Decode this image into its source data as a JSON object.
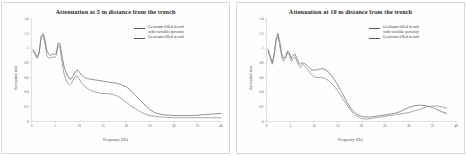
{
  "figure": {
    "panels": [
      {
        "id": "panel-5m",
        "title": "Attenuation at 5 m distance from the trench",
        "xlabel": "Frequency [Hz]",
        "ylabel": "Attenuation ratio",
        "legend": [
          {
            "label": "Geofoam filled trench\nwith variable porosity",
            "color": "#555555"
          },
          {
            "label": "Geofoam filled trench",
            "color": "#555555"
          }
        ]
      },
      {
        "id": "panel-10m",
        "title": "Attenuation at 10 m distance from the trench",
        "xlabel": "Frequency [Hz]",
        "ylabel": "Attenuation ratio",
        "legend": [
          {
            "label": "Geofoam filled trench\nwith variable porosity",
            "color": "#555555"
          },
          {
            "label": "Geofoam filled trench",
            "color": "#555555"
          }
        ]
      }
    ]
  },
  "chart_data": [
    {
      "type": "line",
      "title": "Attenuation at 5 m distance from the trench",
      "xlabel": "Frequency [Hz]",
      "ylabel": "Attenuation ratio",
      "xlim": [
        0,
        40
      ],
      "ylim": [
        0,
        1.4
      ],
      "xticks": [
        0,
        5,
        10,
        15,
        20,
        25,
        30,
        35,
        40
      ],
      "yticks": [
        0,
        0.2,
        0.4,
        0.6,
        0.8,
        1,
        1.2,
        1.4
      ],
      "xticklabels": [
        "0",
        "5",
        "10",
        "15",
        "20",
        "25",
        "30",
        "35",
        "40"
      ],
      "yticklabels": [
        "0",
        "0.2",
        "0.4",
        "0.6",
        "0.8",
        "1",
        "1.2",
        "1.4"
      ],
      "grid": false,
      "legend_position": "upper right",
      "series": [
        {
          "name": "Geofoam filled trench with variable porosity",
          "color": "#555555",
          "x": [
            0.3,
            0.8,
            1.2,
            1.6,
            2.0,
            2.4,
            2.8,
            3.2,
            3.6,
            4.0,
            4.4,
            4.8,
            5.2,
            5.6,
            6.0,
            6.4,
            6.8,
            7.2,
            7.6,
            8.0,
            8.4,
            8.8,
            9.2,
            9.6,
            10.0,
            10.6,
            11.2,
            12.0,
            13.0,
            14.0,
            15.0,
            16.0,
            17.0,
            18.0,
            19.0,
            20.0,
            21.0,
            22.0,
            23.0,
            24.0,
            25.0,
            26.0,
            27.0,
            28.0,
            30.0,
            32.0,
            34.0,
            36.0,
            38.0,
            40.0
          ],
          "y": [
            0.98,
            0.92,
            0.88,
            0.95,
            1.16,
            1.2,
            1.12,
            0.97,
            0.92,
            0.9,
            0.92,
            0.91,
            0.93,
            1.07,
            1.06,
            0.9,
            0.76,
            0.68,
            0.62,
            0.58,
            0.58,
            0.62,
            0.68,
            0.7,
            0.68,
            0.63,
            0.6,
            0.58,
            0.57,
            0.56,
            0.55,
            0.54,
            0.53,
            0.52,
            0.5,
            0.47,
            0.42,
            0.35,
            0.28,
            0.22,
            0.16,
            0.12,
            0.1,
            0.09,
            0.08,
            0.08,
            0.08,
            0.09,
            0.1,
            0.11
          ]
        },
        {
          "name": "Geofoam filled trench",
          "color": "#777777",
          "x": [
            0.3,
            0.8,
            1.2,
            1.6,
            2.0,
            2.4,
            2.8,
            3.2,
            3.6,
            4.0,
            4.4,
            4.8,
            5.2,
            5.6,
            6.0,
            6.4,
            6.8,
            7.2,
            7.6,
            8.0,
            8.4,
            8.8,
            9.2,
            9.6,
            10.0,
            10.6,
            11.2,
            12.0,
            13.0,
            14.0,
            15.0,
            16.0,
            17.0,
            18.0,
            19.0,
            20.0,
            21.0,
            22.0,
            23.0,
            24.0,
            25.0,
            26.0,
            27.0,
            28.0,
            30.0,
            32.0,
            34.0,
            36.0,
            38.0,
            40.0
          ],
          "y": [
            0.96,
            0.9,
            0.86,
            0.93,
            1.14,
            1.17,
            1.07,
            0.9,
            0.86,
            0.87,
            0.88,
            0.87,
            0.9,
            1.04,
            1.0,
            0.82,
            0.66,
            0.58,
            0.52,
            0.5,
            0.52,
            0.57,
            0.61,
            0.62,
            0.58,
            0.52,
            0.48,
            0.44,
            0.41,
            0.39,
            0.38,
            0.38,
            0.37,
            0.35,
            0.31,
            0.26,
            0.21,
            0.17,
            0.13,
            0.1,
            0.08,
            0.07,
            0.06,
            0.06,
            0.05,
            0.05,
            0.05,
            0.05,
            0.05,
            0.05
          ]
        }
      ]
    },
    {
      "type": "line",
      "title": "Attenuation at 10 m distance from the trench",
      "xlabel": "Frequency [Hz]",
      "ylabel": "Attenuation ratio",
      "xlim": [
        0,
        40
      ],
      "ylim": [
        0,
        1.4
      ],
      "xticks": [
        0,
        5,
        10,
        15,
        20,
        25,
        30,
        35,
        40
      ],
      "yticks": [
        0,
        0.2,
        0.4,
        0.6,
        0.8,
        1,
        1.2,
        1.4
      ],
      "xticklabels": [
        "0",
        "5",
        "10",
        "15",
        "20",
        "25",
        "30",
        "35",
        "40"
      ],
      "yticklabels": [
        "0",
        "0.2",
        "0.4",
        "0.6",
        "0.8",
        "1",
        "1.2",
        "1.4"
      ],
      "grid": false,
      "legend_position": "upper right",
      "series": [
        {
          "name": "Geofoam filled trench with variable porosity",
          "color": "#555555",
          "x": [
            0.3,
            0.8,
            1.2,
            1.6,
            2.0,
            2.4,
            2.8,
            3.2,
            3.6,
            4.0,
            4.4,
            4.8,
            5.2,
            5.6,
            6.0,
            6.4,
            6.8,
            7.2,
            7.6,
            8.0,
            8.6,
            9.2,
            9.8,
            10.4,
            11.0,
            11.6,
            12.2,
            13.0,
            14.0,
            15.0,
            16.0,
            17.0,
            18.0,
            19.0,
            20.0,
            21.0,
            22.0,
            23.0,
            24.0,
            25.0,
            26.0,
            27.0,
            28.0,
            29.0,
            30.0,
            31.0,
            32.0,
            33.0,
            34.0,
            35.0,
            36.0,
            37.0,
            38.0
          ],
          "y": [
            0.98,
            0.88,
            0.8,
            0.92,
            1.12,
            1.2,
            1.08,
            0.92,
            0.86,
            0.88,
            0.96,
            0.94,
            0.86,
            0.9,
            0.92,
            0.86,
            0.8,
            0.78,
            0.8,
            0.79,
            0.76,
            0.72,
            0.7,
            0.7,
            0.71,
            0.72,
            0.71,
            0.68,
            0.6,
            0.5,
            0.38,
            0.26,
            0.16,
            0.1,
            0.07,
            0.06,
            0.06,
            0.07,
            0.08,
            0.09,
            0.1,
            0.11,
            0.13,
            0.16,
            0.19,
            0.21,
            0.22,
            0.22,
            0.21,
            0.19,
            0.16,
            0.13,
            0.11
          ]
        },
        {
          "name": "Geofoam filled trench",
          "color": "#777777",
          "x": [
            0.3,
            0.8,
            1.2,
            1.6,
            2.0,
            2.4,
            2.8,
            3.2,
            3.6,
            4.0,
            4.4,
            4.8,
            5.2,
            5.6,
            6.0,
            6.4,
            6.8,
            7.2,
            7.6,
            8.0,
            8.6,
            9.2,
            9.8,
            10.4,
            11.0,
            11.6,
            12.2,
            13.0,
            14.0,
            15.0,
            16.0,
            17.0,
            18.0,
            19.0,
            20.0,
            21.0,
            22.0,
            23.0,
            24.0,
            25.0,
            26.0,
            27.0,
            28.0,
            29.0,
            30.0,
            31.0,
            32.0,
            33.0,
            34.0,
            35.0,
            36.0,
            37.0,
            38.0
          ],
          "y": [
            0.96,
            0.86,
            0.78,
            0.9,
            1.1,
            1.16,
            1.02,
            0.88,
            0.82,
            0.86,
            0.94,
            0.9,
            0.82,
            0.86,
            0.88,
            0.82,
            0.76,
            0.74,
            0.78,
            0.76,
            0.71,
            0.66,
            0.62,
            0.6,
            0.6,
            0.6,
            0.59,
            0.56,
            0.5,
            0.42,
            0.32,
            0.22,
            0.13,
            0.07,
            0.04,
            0.03,
            0.04,
            0.05,
            0.06,
            0.07,
            0.08,
            0.09,
            0.1,
            0.11,
            0.12,
            0.14,
            0.16,
            0.18,
            0.2,
            0.21,
            0.21,
            0.2,
            0.18
          ]
        }
      ]
    }
  ]
}
